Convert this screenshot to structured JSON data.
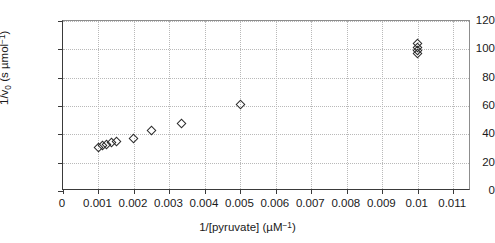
{
  "chart_data": {
    "type": "scatter",
    "title": "",
    "xlabel": "1/[pyruvate] (µM⁻¹)",
    "ylabel": "1/v₀ (s µmol⁻¹)",
    "xlim": [
      0,
      0.0115
    ],
    "ylim": [
      0,
      120
    ],
    "grid": true,
    "legend": "none",
    "xticks": [
      0,
      0.001,
      0.002,
      0.003,
      0.004,
      0.005,
      0.006,
      0.007,
      0.008,
      0.009,
      0.01,
      0.011
    ],
    "xtick_labels": [
      "0",
      "0.001",
      "0.002",
      "0.003",
      "0.004",
      "0.005",
      "0.006",
      "0.007",
      "0.008",
      "0.009",
      "0.01",
      "0.011"
    ],
    "yticks": [
      0,
      20,
      40,
      60,
      80,
      100,
      120
    ],
    "ytick_labels": [
      "0",
      "20",
      "40",
      "60",
      "80",
      "100",
      "120"
    ],
    "series": [
      {
        "name": "1/v0 vs 1/[pyruvate]",
        "marker": "open-diamond",
        "color": "#2b2b2b",
        "points": [
          {
            "x": 0.001,
            "y": 31
          },
          {
            "x": 0.00112,
            "y": 32
          },
          {
            "x": 0.00124,
            "y": 33
          },
          {
            "x": 0.00136,
            "y": 34
          },
          {
            "x": 0.0015,
            "y": 35
          },
          {
            "x": 0.002,
            "y": 37
          },
          {
            "x": 0.0025,
            "y": 43
          },
          {
            "x": 0.00333,
            "y": 48
          },
          {
            "x": 0.005,
            "y": 61
          },
          {
            "x": 0.01,
            "y": 104
          },
          {
            "x": 0.01,
            "y": 101
          },
          {
            "x": 0.01,
            "y": 99
          },
          {
            "x": 0.01,
            "y": 97
          }
        ]
      }
    ]
  }
}
